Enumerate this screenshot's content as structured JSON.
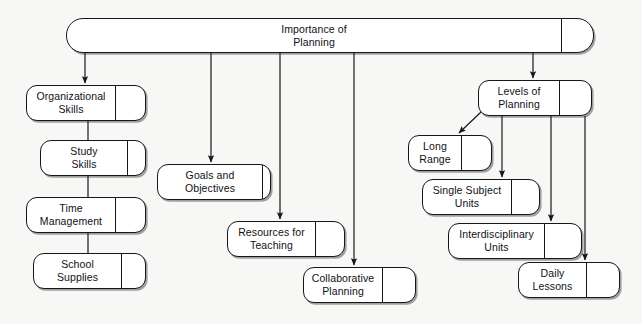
{
  "diagram": {
    "type": "concept-map",
    "background_color": "#f7f7f5",
    "line_color": "#17171a",
    "node_fill": "#ffffff"
  },
  "nodes": [
    {
      "id": "root",
      "name": "importance-of-planning",
      "lines": [
        "Importance of",
        "Planning"
      ],
      "x": 66,
      "y": 18,
      "w": 528,
      "h": 35,
      "divider_x": 494,
      "text_w": 494
    },
    {
      "id": "organizational-skills",
      "name": "organizational-skills",
      "lines": [
        "Organizational",
        "Skills"
      ],
      "x": 26,
      "y": 85,
      "w": 120,
      "h": 36,
      "divider_x": 88,
      "text_w": 88
    },
    {
      "id": "study-skills",
      "name": "study-skills",
      "lines": [
        "Study",
        "Skills"
      ],
      "x": 40,
      "y": 140,
      "w": 106,
      "h": 36,
      "divider_x": 86,
      "text_w": 86
    },
    {
      "id": "time-management",
      "name": "time-management",
      "lines": [
        "Time",
        "Management"
      ],
      "x": 26,
      "y": 197,
      "w": 120,
      "h": 36,
      "divider_x": 88,
      "text_w": 88
    },
    {
      "id": "school-supplies",
      "name": "school-supplies",
      "lines": [
        "School",
        "Supplies"
      ],
      "x": 33,
      "y": 253,
      "w": 113,
      "h": 36,
      "divider_x": 87,
      "text_w": 87
    },
    {
      "id": "goals-and-objectives",
      "name": "goals-and-objectives",
      "lines": [
        "Goals and",
        "Objectives"
      ],
      "x": 157,
      "y": 164,
      "w": 114,
      "h": 36,
      "divider_x": 104,
      "text_w": 104
    },
    {
      "id": "resources-for-teaching",
      "name": "resources-for-teaching",
      "lines": [
        "Resources for",
        "Teaching"
      ],
      "x": 227,
      "y": 221,
      "w": 118,
      "h": 36,
      "divider_x": 87,
      "text_w": 87
    },
    {
      "id": "collaborative-planning",
      "name": "collaborative-planning",
      "lines": [
        "Collaborative",
        "Planning"
      ],
      "x": 303,
      "y": 267,
      "w": 113,
      "h": 36,
      "divider_x": 78,
      "text_w": 78
    },
    {
      "id": "levels-of-planning",
      "name": "levels-of-planning",
      "lines": [
        "Levels of",
        "Planning"
      ],
      "x": 478,
      "y": 80,
      "w": 114,
      "h": 36,
      "divider_x": 80,
      "text_w": 80
    },
    {
      "id": "long-range",
      "name": "long-range",
      "lines": [
        "Long",
        "Range"
      ],
      "x": 408,
      "y": 135,
      "w": 84,
      "h": 36,
      "divider_x": 52,
      "text_w": 52
    },
    {
      "id": "single-subject-units",
      "name": "single-subject-units",
      "lines": [
        "Single Subject",
        "Units"
      ],
      "x": 422,
      "y": 179,
      "w": 118,
      "h": 36,
      "divider_x": 88,
      "text_w": 88
    },
    {
      "id": "interdisciplinary-units",
      "name": "interdisciplinary-units",
      "lines": [
        "Interdisciplinary",
        "Units"
      ],
      "x": 448,
      "y": 223,
      "w": 134,
      "h": 36,
      "divider_x": 95,
      "text_w": 95
    },
    {
      "id": "daily-lessons",
      "name": "daily-lessons",
      "lines": [
        "Daily",
        "Lessons"
      ],
      "x": 518,
      "y": 262,
      "w": 102,
      "h": 36,
      "divider_x": 67,
      "text_w": 67
    }
  ],
  "edges": [
    {
      "name": "edge-root-to-organizational-skills",
      "from": "root",
      "to": "organizational-skills",
      "arrow": true,
      "points": "85,53 85,83"
    },
    {
      "name": "edge-root-to-goals-and-objectives",
      "from": "root",
      "to": "goals-and-objectives",
      "arrow": true,
      "points": "211,53 211,162"
    },
    {
      "name": "edge-root-to-resources-for-teaching",
      "from": "root",
      "to": "resources-for-teaching",
      "arrow": true,
      "points": "280,53 280,219"
    },
    {
      "name": "edge-root-to-collaborative-planning",
      "from": "root",
      "to": "collaborative-planning",
      "arrow": true,
      "points": "354,53 354,265"
    },
    {
      "name": "edge-root-to-levels-of-planning",
      "from": "root",
      "to": "levels-of-planning",
      "arrow": true,
      "points": "533,53 533,78"
    },
    {
      "name": "edge-organizational-skills-to-study-skills",
      "from": "organizational-skills",
      "to": "study-skills",
      "arrow": false,
      "points": "88,121 88,140"
    },
    {
      "name": "edge-study-skills-to-time-management",
      "from": "study-skills",
      "to": "time-management",
      "arrow": false,
      "points": "88,176 88,197"
    },
    {
      "name": "edge-time-management-to-school-supplies",
      "from": "time-management",
      "to": "school-supplies",
      "arrow": false,
      "points": "88,233 88,253"
    },
    {
      "name": "edge-levels-of-planning-to-long-range",
      "from": "levels-of-planning",
      "to": "long-range",
      "arrow": true,
      "points": "481,112 459,133"
    },
    {
      "name": "edge-levels-of-planning-to-single-subject-units",
      "from": "levels-of-planning",
      "to": "single-subject-units",
      "arrow": true,
      "points": "502,116 502,177"
    },
    {
      "name": "edge-levels-of-planning-to-interdisciplinary-units",
      "from": "levels-of-planning",
      "to": "interdisciplinary-units",
      "arrow": true,
      "points": "551,116 551,221"
    },
    {
      "name": "edge-levels-of-planning-to-daily-lessons",
      "from": "levels-of-planning",
      "to": "daily-lessons",
      "arrow": true,
      "points": "585,116 585,260"
    }
  ]
}
